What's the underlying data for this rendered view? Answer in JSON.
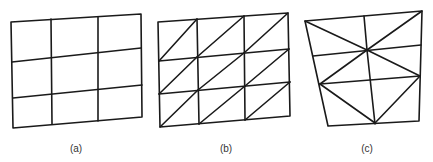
{
  "figure": {
    "panels": [
      {
        "id": "a",
        "label": "(a)",
        "description": "3x3 quadrilateral grid",
        "label_pos": [
          76,
          143
        ],
        "outline": [
          [
            11,
            22
          ],
          [
            141,
            14
          ],
          [
            142,
            117
          ],
          [
            13,
            128
          ]
        ],
        "lines": [
          [
            51,
            19,
            52,
            124
          ],
          [
            98,
            17,
            98,
            121
          ],
          [
            12,
            62,
            141,
            48
          ],
          [
            13,
            98,
            142,
            85
          ]
        ]
      },
      {
        "id": "b",
        "label": "(b)",
        "description": "3x3 grid split into triangles by diagonals",
        "label_pos": [
          226,
          143
        ],
        "outline": [
          [
            158,
            22
          ],
          [
            288,
            13
          ],
          [
            290,
            116
          ],
          [
            160,
            127
          ]
        ],
        "lines": [
          [
            197,
            19,
            199,
            124
          ],
          [
            244,
            16,
            245,
            120
          ],
          [
            159,
            61,
            289,
            49
          ],
          [
            159,
            94,
            290,
            82
          ],
          [
            159,
            61,
            197,
            19
          ],
          [
            197,
            57,
            244,
            16
          ],
          [
            244,
            53,
            288,
            13
          ],
          [
            159,
            94,
            197,
            57
          ],
          [
            198,
            90,
            244,
            53
          ],
          [
            245,
            86,
            289,
            49
          ],
          [
            160,
            127,
            198,
            90
          ],
          [
            199,
            124,
            245,
            86
          ],
          [
            245,
            120,
            290,
            82
          ]
        ]
      },
      {
        "id": "c",
        "label": "(c)",
        "description": "Irregular triangulated mesh with central node",
        "label_pos": [
          367,
          143
        ],
        "outline": [
          [
            305,
            21
          ],
          [
            422,
            11
          ],
          [
            419,
            121
          ],
          [
            328,
            126
          ]
        ],
        "lines": [
          [
            364,
            16,
            367,
            50
          ],
          [
            367,
            50,
            375,
            124
          ],
          [
            313,
            56,
            421,
            45
          ],
          [
            320,
            84,
            420,
            76
          ],
          [
            305,
            21,
            367,
            50
          ],
          [
            422,
            11,
            367,
            50
          ],
          [
            367,
            50,
            320,
            84
          ],
          [
            367,
            50,
            420,
            76
          ],
          [
            320,
            84,
            375,
            123
          ],
          [
            420,
            76,
            375,
            123
          ]
        ]
      }
    ]
  }
}
